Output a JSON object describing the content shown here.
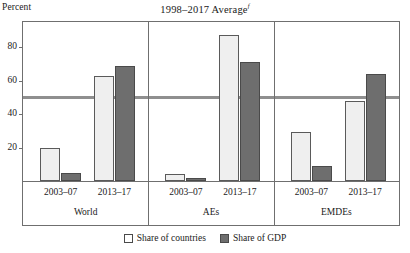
{
  "chart_data": {
    "type": "bar",
    "title": "1998–2017 Average",
    "title_superscript": "f",
    "ylabel": "Percent",
    "xlabel": "",
    "ylim": [
      0,
      95
    ],
    "yticks": [
      20,
      40,
      60,
      80
    ],
    "ytick_labels": [
      "20",
      "40",
      "60",
      "80"
    ],
    "grid": false,
    "legend_position": "bottom-center",
    "reference_line": {
      "value": 50,
      "orientation": "horizontal",
      "color": "#8f8f8f"
    },
    "groups": [
      "World",
      "AEs",
      "EMDEs"
    ],
    "categories": [
      "2003–07",
      "2013–17",
      "2003–07",
      "2013–17",
      "2003–07",
      "2013–17"
    ],
    "series": [
      {
        "name": "Share of countries",
        "color": "#efefef",
        "values": [
          20,
          63,
          4,
          87,
          29,
          48
        ]
      },
      {
        "name": "Share of GDP",
        "color": "#6e6e6e",
        "values": [
          5,
          69,
          2,
          71,
          9,
          64
        ]
      }
    ],
    "bars": [
      {
        "group": "World",
        "period": "2003–07",
        "series": "Share of countries",
        "value": 20
      },
      {
        "group": "World",
        "period": "2003–07",
        "series": "Share of GDP",
        "value": 5
      },
      {
        "group": "World",
        "period": "2013–17",
        "series": "Share of countries",
        "value": 63
      },
      {
        "group": "World",
        "period": "2013–17",
        "series": "Share of GDP",
        "value": 69
      },
      {
        "group": "AEs",
        "period": "2003–07",
        "series": "Share of countries",
        "value": 4
      },
      {
        "group": "AEs",
        "period": "2003–07",
        "series": "Share of GDP",
        "value": 2
      },
      {
        "group": "AEs",
        "period": "2013–17",
        "series": "Share of countries",
        "value": 87
      },
      {
        "group": "AEs",
        "period": "2013–17",
        "series": "Share of GDP",
        "value": 71
      },
      {
        "group": "EMDEs",
        "period": "2003–07",
        "series": "Share of countries",
        "value": 29
      },
      {
        "group": "EMDEs",
        "period": "2003–07",
        "series": "Share of GDP",
        "value": 9
      },
      {
        "group": "EMDEs",
        "period": "2013–17",
        "series": "Share of countries",
        "value": 48
      },
      {
        "group": "EMDEs",
        "period": "2013–17",
        "series": "Share of GDP",
        "value": 64
      }
    ]
  },
  "axis": {
    "unit_label": "Percent"
  },
  "legend": {
    "items": [
      {
        "label": "Share of countries",
        "style": "light"
      },
      {
        "label": "Share of GDP",
        "style": "dark"
      }
    ]
  },
  "colors": {
    "light_bar": "#efefef",
    "dark_bar": "#6e6e6e",
    "frame": "#6f6f6f",
    "reference_line": "#8f8f8f"
  }
}
